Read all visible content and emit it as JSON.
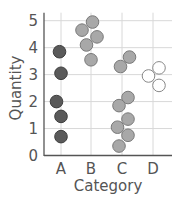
{
  "chart_data": {
    "type": "scatter",
    "title": "",
    "xlabel": "Category",
    "ylabel": "Quantity",
    "categories": [
      "A",
      "B",
      "C",
      "D"
    ],
    "ylim": [
      0,
      5
    ],
    "yticks": [
      "0",
      "1",
      "2",
      "3",
      "4",
      "5"
    ],
    "grid": true,
    "series": [
      {
        "name": "A",
        "color": "#5a5a5a",
        "stroke": "#3e3e3e",
        "points": [
          [
            -0.05,
            3.85
          ],
          [
            0,
            3.05
          ],
          [
            -0.15,
            2.0
          ],
          [
            0,
            1.45
          ],
          [
            0,
            0.7
          ]
        ]
      },
      {
        "name": "B",
        "color": "#a8a8a8",
        "stroke": "#7a7a7a",
        "points": [
          [
            0.05,
            4.95
          ],
          [
            -0.3,
            4.65
          ],
          [
            0.2,
            4.4
          ],
          [
            -0.15,
            4.1
          ],
          [
            0,
            3.55
          ]
        ]
      },
      {
        "name": "C",
        "color": "#a8a8a8",
        "stroke": "#7a7a7a",
        "points": [
          [
            0.25,
            3.65
          ],
          [
            -0.05,
            3.3
          ],
          [
            0.2,
            2.15
          ],
          [
            -0.1,
            1.85
          ],
          [
            0.2,
            1.35
          ],
          [
            -0.15,
            1.05
          ],
          [
            0.2,
            0.75
          ],
          [
            -0.1,
            0.35
          ]
        ]
      },
      {
        "name": "D",
        "color": "#ffffff",
        "stroke": "#888888",
        "points": [
          [
            0.2,
            3.25
          ],
          [
            -0.15,
            2.95
          ],
          [
            0.2,
            2.6
          ]
        ]
      }
    ]
  }
}
